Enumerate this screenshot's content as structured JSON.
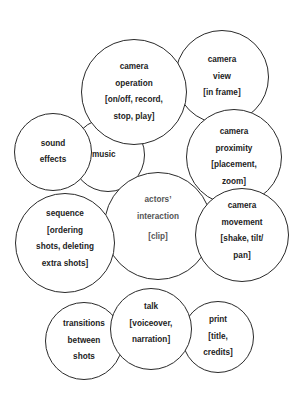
{
  "diagram": {
    "type": "overlapping-circles",
    "border_color": "#2a2a2a",
    "text_color": "#222222",
    "nodes": [
      {
        "id": "camera-view",
        "lines": [
          "camera",
          "view",
          "[in frame]"
        ],
        "cx": 222,
        "cy": 77,
        "r": 47
      },
      {
        "id": "camera-proximity",
        "lines": [
          "camera",
          "proximity",
          "[placement,",
          "zoom]"
        ],
        "cx": 234,
        "cy": 157,
        "r": 48
      },
      {
        "id": "music",
        "lines": [
          "music"
        ],
        "cx": 108,
        "cy": 155,
        "r": 37
      },
      {
        "id": "camera-operation",
        "lines": [
          "camera",
          "operation",
          "[on/off, record,",
          "stop, play]"
        ],
        "cx": 134,
        "cy": 92,
        "r": 53
      },
      {
        "id": "sound-effects",
        "lines": [
          "sound",
          "effects"
        ],
        "cx": 53,
        "cy": 152,
        "r": 39
      },
      {
        "id": "actors-interaction",
        "lines": [
          "actors’",
          "interaction",
          "[clip]"
        ],
        "cx": 158,
        "cy": 226,
        "r": 54
      },
      {
        "id": "sequence",
        "lines": [
          "sequence",
          "[ordering",
          "shots, deleting",
          "extra shots]"
        ],
        "cx": 65,
        "cy": 243,
        "r": 50
      },
      {
        "id": "camera-movement",
        "lines": [
          "camera",
          "movement",
          "[shake, tilt/",
          "pan]"
        ],
        "cx": 242,
        "cy": 235,
        "r": 47
      },
      {
        "id": "transitions",
        "lines": [
          "transitions",
          "between",
          "shots"
        ],
        "cx": 84,
        "cy": 341,
        "r": 39
      },
      {
        "id": "print",
        "lines": [
          "print",
          "[title,",
          "credits]"
        ],
        "cx": 218,
        "cy": 337,
        "r": 36
      },
      {
        "id": "talk",
        "lines": [
          "talk",
          "[voiceover,",
          "narration]"
        ],
        "cx": 150,
        "cy": 329,
        "r": 41
      }
    ]
  }
}
